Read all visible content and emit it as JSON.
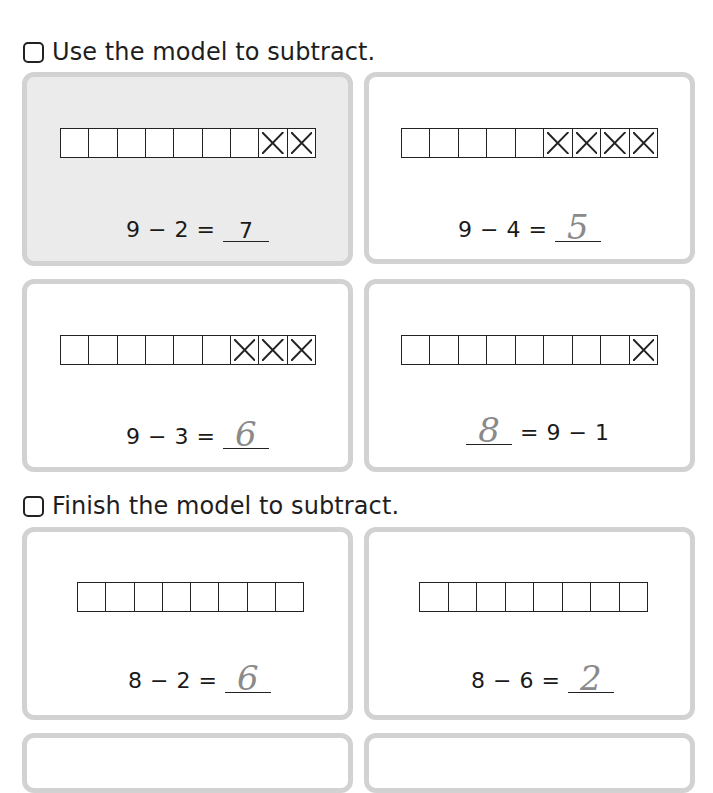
{
  "sections": [
    {
      "heading": "Use the model to subtract.",
      "cards": [
        {
          "shaded": true,
          "total_boxes": 9,
          "crossed": 2,
          "equation": [
            "9",
            "−",
            "2",
            "="
          ],
          "answer": "7",
          "answer_style": "print",
          "answer_position": "after"
        },
        {
          "shaded": false,
          "total_boxes": 9,
          "crossed": 4,
          "equation": [
            "9",
            "−",
            "4",
            "="
          ],
          "answer": "5",
          "answer_style": "handwritten",
          "answer_position": "after"
        },
        {
          "shaded": false,
          "total_boxes": 9,
          "crossed": 3,
          "equation": [
            "9",
            "−",
            "3",
            "="
          ],
          "answer": "6",
          "answer_style": "handwritten",
          "answer_position": "after"
        },
        {
          "shaded": false,
          "total_boxes": 9,
          "crossed": 1,
          "equation": [
            "=",
            "9",
            "−",
            "1"
          ],
          "answer": "8",
          "answer_style": "handwritten",
          "answer_position": "before"
        }
      ]
    },
    {
      "heading": "Finish the model to subtract.",
      "cards": [
        {
          "shaded": false,
          "total_boxes": 8,
          "crossed": 0,
          "equation": [
            "8",
            "−",
            "2",
            "="
          ],
          "answer": "6",
          "answer_style": "handwritten",
          "answer_position": "after"
        },
        {
          "shaded": false,
          "total_boxes": 8,
          "crossed": 0,
          "equation": [
            "8",
            "−",
            "6",
            "="
          ],
          "answer": "2",
          "answer_style": "handwritten",
          "answer_position": "after"
        }
      ]
    }
  ],
  "colors": {
    "card_border": "#d2d2d2",
    "shaded_card_bg": "#ebebeb",
    "ink": "#1a1a1a",
    "pencil": "#8a8a8a"
  }
}
